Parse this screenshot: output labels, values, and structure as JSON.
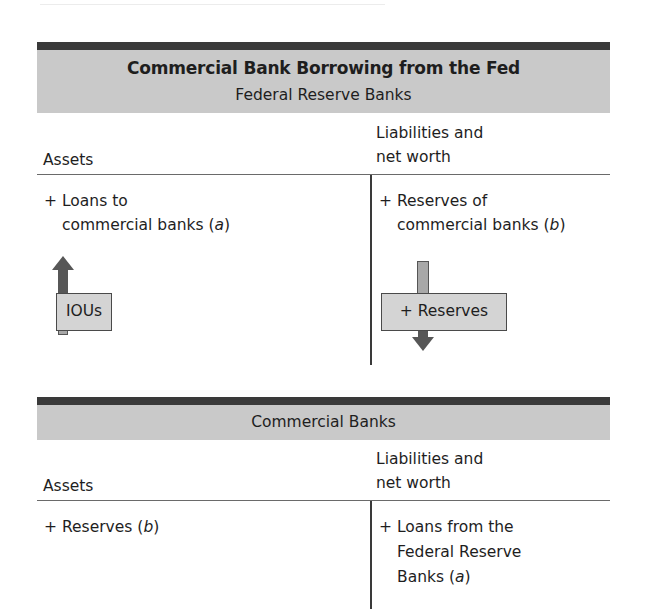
{
  "fed_account": {
    "title": "Commercial Bank Borrowing from the Fed",
    "subtitle": "Federal Reserve Banks",
    "assets_header": "Assets",
    "liabilities_header_line1": "Liabilities and",
    "liabilities_header_line2": "net worth",
    "assets_entry": {
      "sign": "+",
      "line1": "Loans to",
      "line2": "commercial banks",
      "tag": "a"
    },
    "liabilities_entry": {
      "sign": "+",
      "line1": "Reserves of",
      "line2": "commercial banks",
      "tag": "b"
    },
    "left_flow_label": "IOUs",
    "left_flow_icon": "arrow-up-icon",
    "right_flow_label": "+ Reserves",
    "right_flow_icon": "arrow-down-icon"
  },
  "bank_account": {
    "title": "Commercial Banks",
    "assets_header": "Assets",
    "liabilities_header_line1": "Liabilities and",
    "liabilities_header_line2": "net worth",
    "assets_entry": {
      "sign": "+",
      "line1": "Reserves",
      "tag": "b"
    },
    "liabilities_entry": {
      "sign": "+",
      "line1": "Loans from the",
      "line2": "Federal Reserve",
      "line3": "Banks",
      "tag": "a"
    }
  },
  "colors": {
    "header_bar": "#3a3a3a",
    "header_band": "#c9c9c9",
    "rule": "#6a6a6a",
    "tag_fill": "#d4d4d4",
    "arrow_dark": "#575757",
    "arrow_light": "#a8a8a8"
  }
}
